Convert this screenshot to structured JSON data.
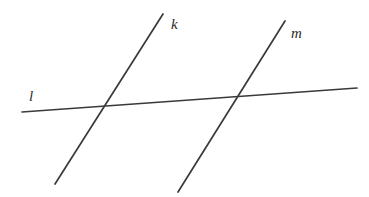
{
  "figure": {
    "background_color": "#ffffff",
    "stroke_color": "#3a3a3a",
    "label_color": "#2b2b2b",
    "width": 369,
    "height": 197,
    "lines": [
      {
        "id": "l",
        "label": "l",
        "role": "transversal",
        "x1": 22,
        "y1": 112,
        "x2": 357,
        "y2": 88,
        "label_x": 29,
        "label_y": 101
      },
      {
        "id": "k",
        "label": "k",
        "role": "parallel-line",
        "x1": 163,
        "y1": 14,
        "x2": 55,
        "y2": 184,
        "label_x": 171,
        "label_y": 29
      },
      {
        "id": "m",
        "label": "m",
        "role": "parallel-line",
        "x1": 285,
        "y1": 21,
        "x2": 178,
        "y2": 192,
        "label_x": 291,
        "label_y": 38
      }
    ],
    "intersections": [
      {
        "id": "k-l",
        "x": 107,
        "y": 106
      },
      {
        "id": "m-l",
        "x": 240,
        "y": 97
      }
    ]
  }
}
